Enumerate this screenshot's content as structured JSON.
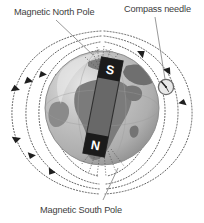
{
  "figure": {
    "title_visible": false,
    "background_color": "#ffffff",
    "labels": {
      "north_pole": "Magnetic North Pole",
      "compass": "Compass needle",
      "south_pole": "Magnetic South Pole"
    },
    "magnet": {
      "south_pole_letter": "S",
      "north_pole_letter": "N",
      "bar_color": "#636363",
      "pole_block_color": "#1c1c1c",
      "pole_letter_color": "#ffffff",
      "tilt_degrees": 12
    },
    "globe": {
      "ocean_color": "#b9b9b9",
      "land_color": "#7b7b7b",
      "highlight_color": "#e2e2e2",
      "outline_color": "#8a8a8a",
      "center_x": 102,
      "center_y": 108,
      "radius": 57
    },
    "field_lines": {
      "style": "dotted",
      "color": "#4a4a4a",
      "arrow_color": "#1f1f1f",
      "loop_count": 6,
      "description": "Dotted magnetic field loops running from the magnet's N end around to the S end with triangular direction arrows"
    },
    "compass": {
      "circle_color": "#6e6e6e",
      "face_color": "#e8e8e8",
      "needle_color": "#2a2a2a",
      "center_x": 166,
      "center_y": 87,
      "radius": 8
    },
    "leader_lines": {
      "color": "#8d8d8d",
      "count": 3
    }
  }
}
